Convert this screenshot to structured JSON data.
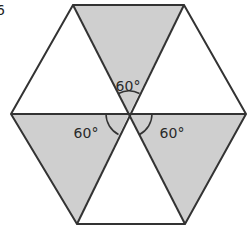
{
  "figure": {
    "corner_label": "6",
    "shape": "regular hexagon divided into six equilateral triangles",
    "shade_color": "#cfcfcf",
    "stroke_color": "#333333",
    "vertices": {
      "top_left": [
        73,
        5
      ],
      "top_right": [
        184,
        5
      ],
      "left": [
        11,
        114
      ],
      "center": [
        129,
        114
      ],
      "right": [
        246,
        114
      ],
      "bottom_left": [
        77,
        224
      ],
      "bottom_right": [
        185,
        224
      ]
    },
    "triangles": [
      {
        "name": "top",
        "shaded": true
      },
      {
        "name": "top-left",
        "shaded": false
      },
      {
        "name": "top-right",
        "shaded": false
      },
      {
        "name": "bottom-left",
        "shaded": true
      },
      {
        "name": "bottom-right",
        "shaded": true
      },
      {
        "name": "bottom",
        "shaded": false
      }
    ],
    "angle_labels": [
      {
        "text": "60°",
        "x": 128,
        "y": 91
      },
      {
        "text": "60°",
        "x": 86,
        "y": 138
      },
      {
        "text": "60°",
        "x": 172,
        "y": 138
      }
    ]
  }
}
